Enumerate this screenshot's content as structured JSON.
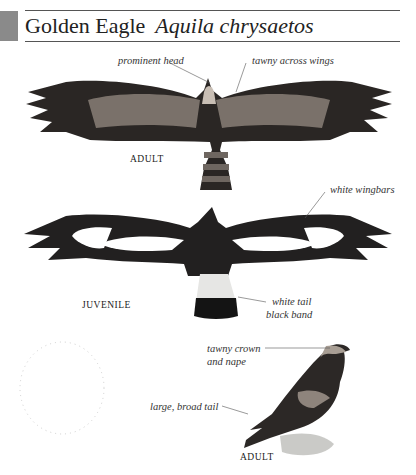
{
  "header": {
    "common_name": "Golden Eagle",
    "scientific_name": "Aquila chrysaetos"
  },
  "figures": {
    "adult_flight": {
      "caption": "ADULT",
      "labels": [
        "prominent head",
        "tawny across wings"
      ]
    },
    "juvenile_flight": {
      "caption": "JUVENILE",
      "labels": [
        "white wingbars",
        "white tail",
        "black band"
      ]
    },
    "adult_perched": {
      "caption": "ADULT",
      "labels": [
        "tawny crown",
        "and nape",
        "large, broad tail"
      ]
    }
  },
  "colors": {
    "header_block": "#8a8a8a",
    "plumage_dark": "#2a2624",
    "plumage_mid": "#4a4440",
    "tawny": "#b8aea4"
  }
}
